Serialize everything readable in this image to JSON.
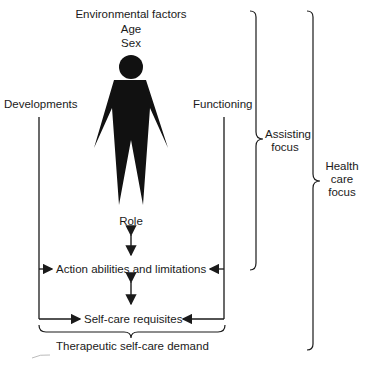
{
  "diagram": {
    "top_labels": [
      "Environmental factors",
      "Age",
      "Sex"
    ],
    "left_label": "Developments",
    "right_label": "Functioning",
    "center_nodes": {
      "role": "Role",
      "action": "Action abilities and limitations",
      "requisites": "Self-care requisites"
    },
    "bottom_label": "Therapeutic self-care demand",
    "brace_labels": {
      "assisting": [
        "Assisting",
        "focus"
      ],
      "health_care": [
        "Health",
        "care",
        "focus"
      ]
    },
    "figure_icon": "person-silhouette"
  }
}
